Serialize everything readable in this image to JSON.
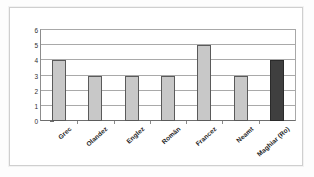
{
  "figure": {
    "background_color": "#ffffff",
    "frame_color": "#cfcfcf"
  },
  "chart_data": {
    "type": "bar",
    "title": "",
    "subtitle": "",
    "xlabel": "",
    "ylabel": "",
    "categories": [
      "Grec",
      "Olandez",
      "Englez",
      "Român",
      "Francez",
      "Neamt",
      "Maghiar (Ro)"
    ],
    "values": [
      4,
      3,
      3,
      3,
      5,
      3,
      4
    ],
    "ylim": [
      0,
      6
    ],
    "yticks": [
      0,
      1,
      2,
      3,
      4,
      5,
      6
    ],
    "ytick_labels": [
      "0",
      "1",
      "2",
      "3",
      "4",
      "5",
      "6"
    ],
    "grid": true,
    "grid_axis": "y",
    "legend": false,
    "legend_position": "none",
    "bar_colors": [
      "#c8c8c8",
      "#c8c8c8",
      "#c8c8c8",
      "#c8c8c8",
      "#c8c8c8",
      "#c8c8c8",
      "#3f3f3f"
    ],
    "bar_styles": [
      "pattern-light",
      "pattern-light",
      "pattern-light",
      "pattern-light",
      "pattern-light",
      "pattern-light",
      "pattern-dark"
    ],
    "bar_edge_color": "#5a5a5a",
    "annotations": []
  }
}
